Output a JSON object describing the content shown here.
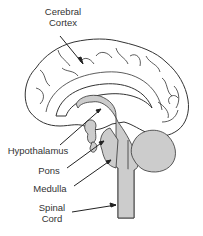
{
  "diagram": {
    "type": "anatomical-illustration",
    "colors": {
      "background": "#ffffff",
      "outline": "#333333",
      "highlight_fill": "#cccccc",
      "label_text": "#333333"
    },
    "labels": [
      {
        "id": "cerebral-cortex",
        "line1": "Cerebral",
        "line2": "Cortex"
      },
      {
        "id": "hypothalamus",
        "line1": "Hypothalamus"
      },
      {
        "id": "pons",
        "line1": "Pons"
      },
      {
        "id": "medulla",
        "line1": "Medulla"
      },
      {
        "id": "spinal-cord",
        "line1": "Spinal",
        "line2": "Cord"
      }
    ]
  }
}
